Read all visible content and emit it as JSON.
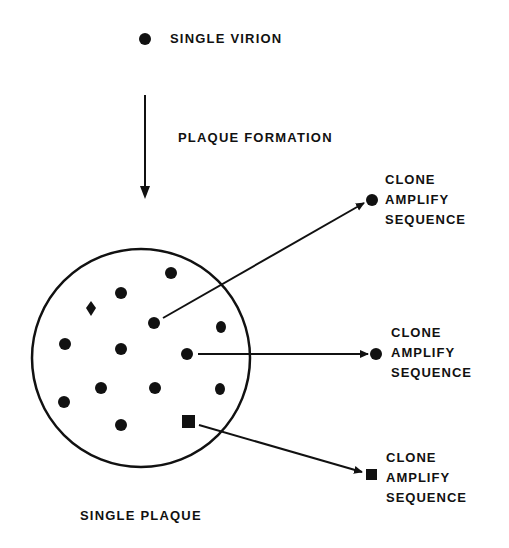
{
  "labels": {
    "single_virion": "SINGLE VIRION",
    "plaque_formation": "PLAQUE FORMATION",
    "single_plaque": "SINGLE PLAQUE"
  },
  "outputs": [
    {
      "marker": "circle",
      "lines": [
        "CLONE",
        "AMPLIFY",
        "SEQUENCE"
      ]
    },
    {
      "marker": "circle",
      "lines": [
        "CLONE",
        "AMPLIFY",
        "SEQUENCE"
      ]
    },
    {
      "marker": "square",
      "lines": [
        "CLONE",
        "AMPLIFY",
        "SEQUENCE"
      ]
    }
  ],
  "plaque": {
    "shape": "circle",
    "particles": [
      {
        "shape": "circle",
        "x": 171,
        "y": 273
      },
      {
        "shape": "circle",
        "x": 121,
        "y": 293
      },
      {
        "shape": "diamond",
        "x": 91,
        "y": 308
      },
      {
        "shape": "circle",
        "x": 154,
        "y": 323
      },
      {
        "shape": "circle",
        "x": 221,
        "y": 327
      },
      {
        "shape": "circle",
        "x": 65,
        "y": 344
      },
      {
        "shape": "circle",
        "x": 121,
        "y": 349
      },
      {
        "shape": "circle",
        "x": 187,
        "y": 354
      },
      {
        "shape": "circle",
        "x": 101,
        "y": 388
      },
      {
        "shape": "circle",
        "x": 155,
        "y": 388
      },
      {
        "shape": "circle",
        "x": 220,
        "y": 389
      },
      {
        "shape": "circle",
        "x": 64,
        "y": 402
      },
      {
        "shape": "circle",
        "x": 121,
        "y": 425
      },
      {
        "shape": "square",
        "x": 188,
        "y": 422
      }
    ]
  },
  "colors": {
    "ink": "#111111",
    "background": "#ffffff"
  }
}
